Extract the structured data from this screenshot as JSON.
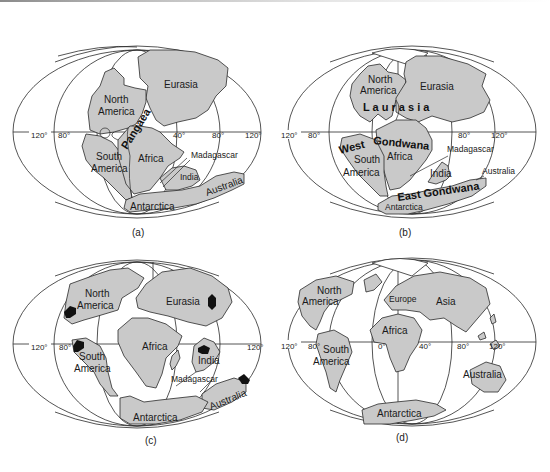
{
  "figure": {
    "panels": [
      {
        "id": "a",
        "caption": "(a)",
        "supercontinent_label": "Pangaea",
        "continents": [
          "Eurasia",
          "North America",
          "South America",
          "Africa",
          "Madagascar",
          "India",
          "Australia",
          "Antarctica"
        ],
        "labels": {
          "eurasia": "Eurasia",
          "north": "North",
          "america": "America",
          "south": "South",
          "america2": "America",
          "africa": "Africa",
          "madagascar": "Madagascar",
          "india": "India",
          "australia": "Australia",
          "antarctica": "Antarctica",
          "pangaea": "Pangaea"
        },
        "longitudes": {
          "w120": "120°",
          "w80": "80°",
          "e40": "40°",
          "e80": "80°",
          "e120": "120°"
        }
      },
      {
        "id": "b",
        "caption": "(b)",
        "supercontinent_labels": [
          "Laurasia",
          "Gondwana",
          "West",
          "East Gondwana"
        ],
        "labels": {
          "north": "North",
          "america": "America",
          "eurasia": "Eurasia",
          "laurasia": "L a u r a s i a",
          "gondwana": "Gondwana",
          "west": "West",
          "south": "South",
          "america2": "America",
          "africa": "Africa",
          "madagascar": "Madagascar",
          "india": "India",
          "australia": "Australia",
          "east_gondwana": "East Gondwana",
          "antarctica": "Antarctica"
        },
        "longitudes": {
          "w120": "120°",
          "w80": "80°",
          "e80": "80°",
          "e120": "120°"
        }
      },
      {
        "id": "c",
        "caption": "(c)",
        "labels": {
          "north": "North",
          "america": "America",
          "eurasia": "Eurasia",
          "africa": "Africa",
          "south": "South",
          "america2": "America",
          "india": "India",
          "madagascar": "Madagascar",
          "australia": "Australia",
          "antarctica": "Antarctica"
        },
        "longitudes": {
          "w120": "120°",
          "w80": "80°",
          "e120": "120°"
        },
        "markers": "black shield/craton symbols on North America, South America, Eurasia, India, Australia"
      },
      {
        "id": "d",
        "caption": "(d)",
        "labels": {
          "north": "North",
          "america": "America",
          "europe": "Europe",
          "asia": "Asia",
          "africa": "Africa",
          "south": "South",
          "america2": "America",
          "australia": "Australia",
          "antarctica": "Antarctica"
        },
        "longitudes": {
          "w120": "120°",
          "w80": "80°",
          "zero": "0°",
          "e40": "40°",
          "e80": "80°",
          "e120": "120°"
        }
      }
    ],
    "colors": {
      "land": "#c9c9c9",
      "outline": "#2a2a2a",
      "background": "#ffffff",
      "markers": "#111111"
    }
  }
}
